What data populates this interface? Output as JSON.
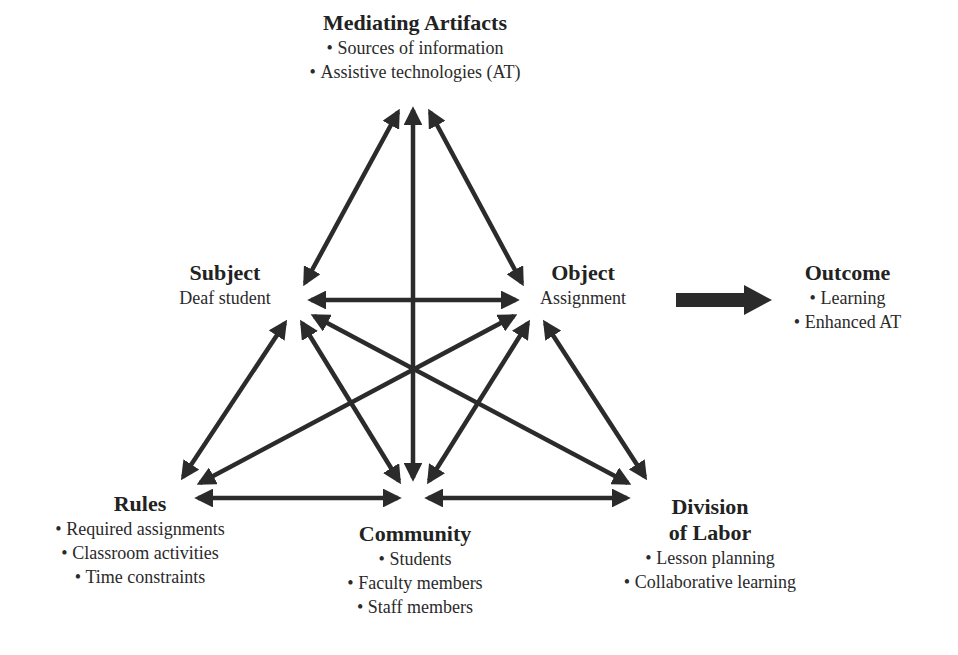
{
  "diagram": {
    "type": "activity-theory-triangle",
    "colors": {
      "arrow": "#2b2b2b",
      "text": "#222222",
      "background": "#ffffff"
    },
    "nodes": {
      "mediating_artifacts": {
        "title": "Mediating Artifacts",
        "items": [
          "Sources of information",
          "Assistive technologies (AT)"
        ]
      },
      "subject": {
        "title": "Subject",
        "subtitle": "Deaf student"
      },
      "object": {
        "title": "Object",
        "subtitle": "Assignment"
      },
      "outcome": {
        "title": "Outcome",
        "items": [
          "Learning",
          "Enhanced AT"
        ]
      },
      "rules": {
        "title": "Rules",
        "items": [
          "Required assignments",
          "Classroom activities",
          "Time constraints"
        ]
      },
      "community": {
        "title": "Community",
        "items": [
          "Students",
          "Faculty members",
          "Staff members"
        ]
      },
      "division_of_labor": {
        "title_line1": "Division",
        "title_line2": "of Labor",
        "items": [
          "Lesson planning",
          "Collaborative learning"
        ]
      }
    },
    "edges": [
      {
        "from": "subject",
        "to": "mediating_artifacts",
        "type": "bidirectional"
      },
      {
        "from": "community",
        "to": "mediating_artifacts",
        "type": "bidirectional"
      },
      {
        "from": "object",
        "to": "mediating_artifacts",
        "type": "bidirectional"
      },
      {
        "from": "subject",
        "to": "object",
        "type": "bidirectional"
      },
      {
        "from": "subject",
        "to": "rules",
        "type": "bidirectional"
      },
      {
        "from": "subject",
        "to": "community",
        "type": "bidirectional"
      },
      {
        "from": "subject",
        "to": "division_of_labor",
        "type": "bidirectional"
      },
      {
        "from": "object",
        "to": "rules",
        "type": "bidirectional"
      },
      {
        "from": "object",
        "to": "community",
        "type": "bidirectional"
      },
      {
        "from": "object",
        "to": "division_of_labor",
        "type": "bidirectional"
      },
      {
        "from": "rules",
        "to": "community",
        "type": "bidirectional"
      },
      {
        "from": "community",
        "to": "division_of_labor",
        "type": "bidirectional"
      },
      {
        "from": "object",
        "to": "outcome",
        "type": "block-arrow"
      }
    ]
  }
}
